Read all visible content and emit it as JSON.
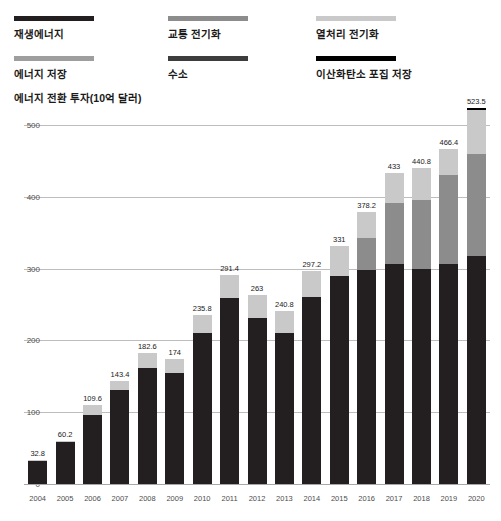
{
  "legend": {
    "items": [
      {
        "label": "재생에너지",
        "color": "#231f20",
        "key": "renewable-energy"
      },
      {
        "label": "교통 전기화",
        "color": "#8c8c8c",
        "key": "transport-electrification"
      },
      {
        "label": "열처리 전기화",
        "color": "#c9c9c9",
        "key": "heat-electrification"
      },
      {
        "label": "에너지 저장",
        "color": "#9e9e9e",
        "key": "energy-storage"
      },
      {
        "label": "수소",
        "color": "#3d3d3d",
        "key": "hydrogen"
      },
      {
        "label": "이산화탄소 포집 저장",
        "color": "#000000",
        "key": "ccs"
      }
    ]
  },
  "axis_title": "에너지 전환 투자(10억 달러)",
  "chart_data": {
    "type": "bar",
    "stacked": true,
    "title": "에너지 전환 투자(10억 달러)",
    "xlabel": "",
    "ylabel": "에너지 전환 투자(10억 달러)",
    "ylim": [
      0,
      500
    ],
    "yticks": [
      0,
      100,
      200,
      300,
      400,
      500
    ],
    "ytick_labels": [
      "0",
      "100",
      "200",
      "300",
      "400",
      "500"
    ],
    "grid": true,
    "legend_position": "top",
    "categories": [
      "2004",
      "2005",
      "2006",
      "2007",
      "2008",
      "2009",
      "2010",
      "2011",
      "2012",
      "2013",
      "2014",
      "2015",
      "2016",
      "2017",
      "2018",
      "2019",
      "2020"
    ],
    "totals": [
      32.8,
      60.2,
      109.6,
      143.4,
      182.6,
      174,
      235.8,
      291.4,
      263,
      240.8,
      297.2,
      331,
      378.2,
      433,
      440.8,
      466.4,
      523.5
    ],
    "total_labels": [
      "32.8",
      "60.2",
      "109.6",
      "143.4",
      "182.6",
      "174",
      "235.8",
      "291.4",
      "263",
      "240.8",
      "297.2",
      "331",
      "378.2",
      "433",
      "440.8",
      "466.4",
      "523.5"
    ],
    "series": [
      {
        "name": "재생에너지",
        "color": "#231f20",
        "values": [
          32.0,
          58.5,
          96.0,
          131.0,
          162.0,
          154.0,
          211.0,
          259.0,
          231.0,
          211.0,
          260.0,
          290.0,
          298.0,
          306.0,
          299.0,
          306.0,
          318.0
        ]
      },
      {
        "name": "교통 전기화",
        "color": "#8c8c8c",
        "values": [
          0.0,
          0.0,
          0.0,
          0.0,
          0.0,
          0.0,
          0.0,
          0.0,
          0.0,
          0.0,
          0.0,
          0.0,
          45.0,
          86.0,
          96.0,
          124.0,
          141.0
        ]
      },
      {
        "name": "열처리 전기화",
        "color": "#c9c9c9",
        "values": [
          0.8,
          1.7,
          13.6,
          12.4,
          20.6,
          20.0,
          24.8,
          32.4,
          32.0,
          29.8,
          37.2,
          41.0,
          35.2,
          41.0,
          45.8,
          36.4,
          61.5
        ]
      },
      {
        "name": "에너지 저장",
        "color": "#9e9e9e",
        "values": [
          0.0,
          0.0,
          0.0,
          0.0,
          0.0,
          0.0,
          0.0,
          0.0,
          0.0,
          0.0,
          0.0,
          0.0,
          0.0,
          0.0,
          0.0,
          0.0,
          0.0
        ]
      },
      {
        "name": "수소",
        "color": "#3d3d3d",
        "values": [
          0.0,
          0.0,
          0.0,
          0.0,
          0.0,
          0.0,
          0.0,
          0.0,
          0.0,
          0.0,
          0.0,
          0.0,
          0.0,
          0.0,
          0.0,
          0.0,
          0.0
        ]
      },
      {
        "name": "이산화탄소 포집 저장",
        "color": "#000000",
        "values": [
          0.0,
          0.0,
          0.0,
          0.0,
          0.0,
          0.0,
          0.0,
          0.0,
          0.0,
          0.0,
          0.0,
          0.0,
          0.0,
          0.0,
          0.0,
          0.0,
          3.0
        ]
      }
    ]
  }
}
